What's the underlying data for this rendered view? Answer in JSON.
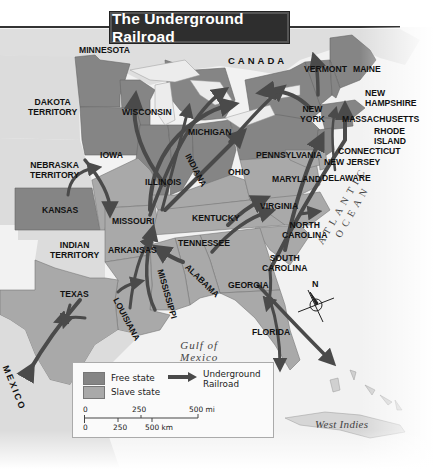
{
  "title": "The Underground Railroad",
  "colors": {
    "free_state": "#858585",
    "slave_state": "#a9a9a9",
    "territory": "#dcdcdc",
    "water": "#f4f4f4",
    "route_arrow": "#4a4a4a",
    "title_bg": "#2e2e2e"
  },
  "regions": {
    "canada": "CANADA",
    "mexico": "MEXICO",
    "gulf": "Gulf of Mexico",
    "gulf_line1": "Gulf of",
    "gulf_line2": "Mexico",
    "atlantic": "ATLANTIC OCEAN",
    "west_indies": "West Indies"
  },
  "states": {
    "minnesota": "MINNESOTA",
    "dakota_1": "DAKOTA",
    "dakota_2": "TERRITORY",
    "wisconsin": "WISCONSIN",
    "michigan": "MICHIGAN",
    "iowa": "IOWA",
    "nebraska_1": "NEBRASKA",
    "nebraska_2": "TERRITORY",
    "illinois": "ILLINOIS",
    "indiana": "INDIANA",
    "ohio": "OHIO",
    "kansas": "KANSAS",
    "missouri": "MISSOURI",
    "kentucky": "KENTUCKY",
    "indian_1": "INDIAN",
    "indian_2": "TERRITORY",
    "arkansas": "ARKANSAS",
    "tennessee": "TENNESSEE",
    "texas": "TEXAS",
    "louisiana": "LOUISIANA",
    "mississippi": "MISSISSIPPI",
    "alabama": "ALABAMA",
    "georgia": "GEORGIA",
    "florida": "FLORIDA",
    "south_carolina_1": "SOUTH",
    "south_carolina_2": "CAROLINA",
    "north_carolina_1": "NORTH",
    "north_carolina_2": "CAROLINA",
    "virginia": "VIRGINIA",
    "maryland": "MARYLAND",
    "delaware": "DELAWARE",
    "new_jersey": "NEW JERSEY",
    "pennsylvania": "PENNSYLVANIA",
    "new_york_1": "NEW",
    "new_york_2": "YORK",
    "vermont": "VERMONT",
    "maine": "MAINE",
    "new_hampshire_1": "NEW",
    "new_hampshire_2": "HAMPSHIRE",
    "massachusetts": "MASSACHUSETTS",
    "rhode_island_1": "RHODE",
    "rhode_island_2": "ISLAND",
    "connecticut": "CONNECTICUT"
  },
  "compass": {
    "north": "N"
  },
  "legend": {
    "free_state": "Free state",
    "slave_state": "Slave state",
    "route_1": "Underground",
    "route_2": "Railroad",
    "scale_mi": {
      "ticks": [
        "0",
        "250",
        "500 mi"
      ]
    },
    "scale_km": {
      "ticks": [
        "0",
        "250",
        "500 km"
      ]
    }
  }
}
